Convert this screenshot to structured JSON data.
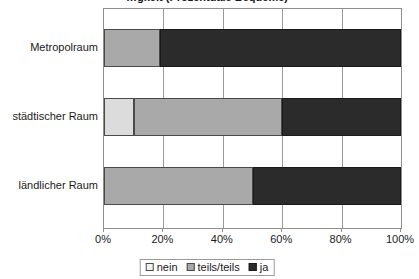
{
  "chart_data": {
    "type": "bar",
    "orientation": "horizontal",
    "stacked": true,
    "stack_mode": "percent",
    "title": "…gkeit (Prozentuale Bequeme)",
    "title_clipped": true,
    "xlabel": "",
    "ylabel": "",
    "xlim": [
      0,
      100
    ],
    "grid": true,
    "grid_axis": "x",
    "legend_position": "bottom-center",
    "categories": [
      "Metropolraum",
      "städtischer Raum",
      "ländlicher Raum"
    ],
    "tick_labels": [
      "0%",
      "20%",
      "40%",
      "60%",
      "80%",
      "100%"
    ],
    "tick_values": [
      0,
      20,
      40,
      60,
      80,
      100
    ],
    "series": [
      {
        "name": "nein",
        "color": "#dcdcdc",
        "values": [
          0,
          10,
          0
        ]
      },
      {
        "name": "teils/teils",
        "color": "#a9a9a9",
        "values": [
          19,
          50,
          50
        ]
      },
      {
        "name": "ja",
        "color": "#2b2b2b",
        "values": [
          81,
          40,
          50
        ]
      }
    ]
  },
  "legend": {
    "items": [
      {
        "label": "nein"
      },
      {
        "label": "teils/teils"
      },
      {
        "label": "ja"
      }
    ]
  }
}
